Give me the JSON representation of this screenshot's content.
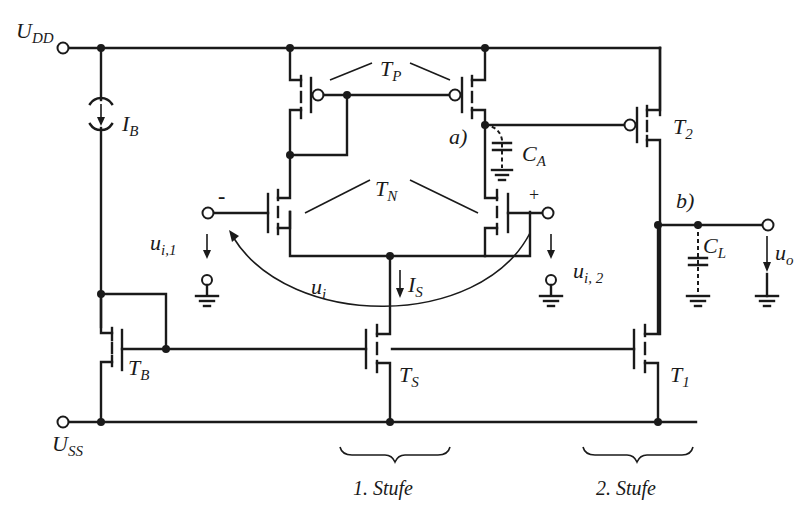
{
  "diagram": {
    "type": "two-stage CMOS operational amplifier schematic",
    "supply": {
      "positive": "U",
      "positive_sub": "DD",
      "negative": "U",
      "negative_sub": "SS"
    },
    "bias_current": {
      "main": "I",
      "sub": "B"
    },
    "tail_current": {
      "main": "I",
      "sub": "S"
    },
    "transistors": {
      "tp": {
        "main": "T",
        "sub": "P"
      },
      "tn": {
        "main": "T",
        "sub": "N"
      },
      "t2": {
        "main": "T",
        "sub": "2"
      },
      "tb": {
        "main": "T",
        "sub": "B"
      },
      "ts": {
        "main": "T",
        "sub": "S"
      },
      "t1": {
        "main": "T",
        "sub": "1"
      }
    },
    "capacitors": {
      "ca": {
        "main": "C",
        "sub": "A"
      },
      "cl": {
        "main": "C",
        "sub": "L"
      }
    },
    "nodes": {
      "a": "a)",
      "b": "b)"
    },
    "inputs": {
      "minus_sign": "-",
      "plus_sign": "+",
      "ui1_main": "u",
      "ui1_sub": "i,1",
      "ui2_main": "u",
      "ui2_sub": "i, 2",
      "ui_main": "u",
      "ui_sub": "i"
    },
    "output": {
      "main": "u",
      "sub": "o"
    },
    "stages": {
      "first": "1. Stufe",
      "second": "2. Stufe"
    }
  }
}
